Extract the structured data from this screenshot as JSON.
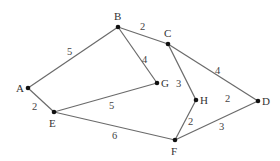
{
  "graph": {
    "nodes": [
      {
        "id": "A",
        "x": 28,
        "y": 88,
        "lx": 16,
        "ly": 92
      },
      {
        "id": "E",
        "x": 54,
        "y": 112,
        "lx": 49,
        "ly": 127
      },
      {
        "id": "B",
        "x": 118,
        "y": 27,
        "lx": 114,
        "ly": 20
      },
      {
        "id": "C",
        "x": 168,
        "y": 44,
        "lx": 164,
        "ly": 37
      },
      {
        "id": "G",
        "x": 157,
        "y": 83,
        "lx": 161,
        "ly": 87
      },
      {
        "id": "H",
        "x": 196,
        "y": 100,
        "lx": 200,
        "ly": 104
      },
      {
        "id": "D",
        "x": 258,
        "y": 101,
        "lx": 262,
        "ly": 105
      },
      {
        "id": "F",
        "x": 175,
        "y": 140,
        "lx": 171,
        "ly": 155
      }
    ],
    "edges": [
      {
        "from": "A",
        "to": "B",
        "weight": "5",
        "lx": 67,
        "ly": 55
      },
      {
        "from": "A",
        "to": "E",
        "weight": "2",
        "lx": 32,
        "ly": 110
      },
      {
        "from": "B",
        "to": "C",
        "weight": "2",
        "lx": 140,
        "ly": 30
      },
      {
        "from": "B",
        "to": "G",
        "weight": "4",
        "lx": 142,
        "ly": 63
      },
      {
        "from": "E",
        "to": "G",
        "weight": "5",
        "lx": 109,
        "ly": 109
      },
      {
        "from": "E",
        "to": "F",
        "weight": "6",
        "lx": 112,
        "ly": 139
      },
      {
        "from": "C",
        "to": "H",
        "weight": "3",
        "lx": 176,
        "ly": 87
      },
      {
        "from": "C",
        "to": "D",
        "weight": "4",
        "lx": 215,
        "ly": 74
      },
      {
        "from": "H",
        "to": "F",
        "weight": "2",
        "lx": 188,
        "ly": 125
      },
      {
        "from": "F",
        "to": "D",
        "weight": "3",
        "lx": 219,
        "ly": 130
      }
    ],
    "floating_labels": [
      {
        "text": "2",
        "x": 225,
        "y": 102
      }
    ]
  }
}
